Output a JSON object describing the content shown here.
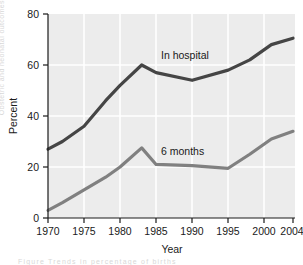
{
  "chart_data": {
    "type": "line",
    "title": "",
    "xlabel": "Year",
    "ylabel": "Percent",
    "xlim": [
      1970,
      2004
    ],
    "ylim": [
      0,
      80
    ],
    "grid": true,
    "legend_position": "inline-annotations",
    "xticks": [
      "1970",
      "1975",
      "1980",
      "1985",
      "1990",
      "1995",
      "2000",
      "2004"
    ],
    "yticks": [
      "0",
      "20",
      "40",
      "60",
      "80"
    ],
    "series": [
      {
        "name": "In hospital",
        "color": "#454545",
        "x": [
          1970,
          1972,
          1975,
          1978,
          1980,
          1983,
          1985,
          1990,
          1995,
          1998,
          2001,
          2004
        ],
        "values": [
          27,
          30,
          36,
          46,
          52,
          60,
          57,
          54,
          58,
          62,
          68,
          70.5
        ]
      },
      {
        "name": "6 months",
        "color": "#808080",
        "x": [
          1970,
          1972,
          1975,
          1978,
          1980,
          1983,
          1985,
          1990,
          1995,
          1998,
          2001,
          2004
        ],
        "values": [
          3,
          6,
          11,
          16,
          20,
          27.5,
          21,
          20.5,
          19.5,
          25,
          31,
          34
        ]
      }
    ],
    "annotations": [
      {
        "text": "In hospital",
        "x": 1991,
        "y": 63
      },
      {
        "text": "6 months",
        "x": 1991,
        "y": 25
      }
    ]
  },
  "axes": {
    "y_title": "Percent",
    "x_title": "Year",
    "y_ticks": [
      "80",
      "60",
      "40",
      "20",
      "0"
    ],
    "x_ticks": [
      "1970",
      "1975",
      "1980",
      "1985",
      "1990",
      "1995",
      "2000",
      "2004"
    ]
  },
  "annotations": {
    "in_hospital": "In hospital",
    "six_months": "6 months"
  },
  "colors": {
    "plot_background": "#ececec",
    "gridline": "#ffffff",
    "axis": "#1a1a1a",
    "in_hospital_line": "#454545",
    "six_months_line": "#808080",
    "page_background": "#ffffff"
  }
}
